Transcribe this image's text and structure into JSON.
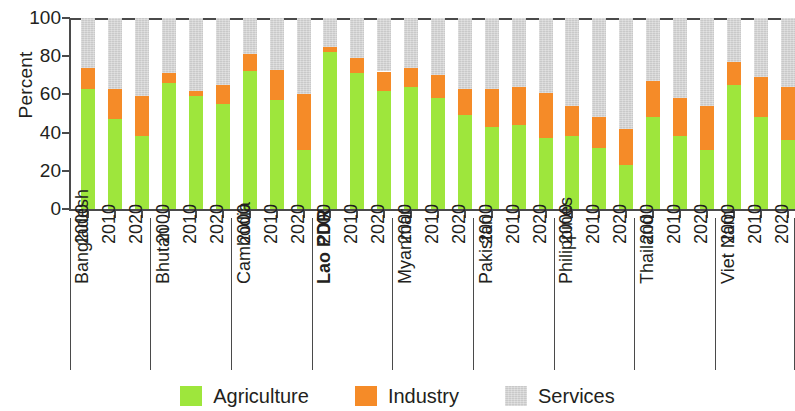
{
  "chart_data": {
    "type": "bar",
    "subtype": "stacked-bar-100",
    "title": "",
    "xlabel": "",
    "ylabel": "Percent",
    "ylim": [
      0,
      100
    ],
    "yticks": [
      0,
      20,
      40,
      60,
      80,
      100
    ],
    "ytick_labels": [
      "0",
      "20",
      "40",
      "60",
      "80",
      "100"
    ],
    "grid": false,
    "legend_position": "bottom-center",
    "legend": [
      "Agriculture",
      "Industry",
      "Services"
    ],
    "series_colors": {
      "Agriculture": "#9ee63c",
      "Industry": "#f58b28",
      "Services": "#c9c9c9"
    },
    "group_label": "country",
    "categories": [
      "2000",
      "2010",
      "2020"
    ],
    "groups": [
      {
        "name": "Bangladesh",
        "emphasis": false,
        "bars": [
          {
            "year": "2000",
            "Agriculture": 63,
            "Industry": 11,
            "Services": 26
          },
          {
            "year": "2010",
            "Agriculture": 47,
            "Industry": 16,
            "Services": 37
          },
          {
            "year": "2020",
            "Agriculture": 38,
            "Industry": 21,
            "Services": 41
          }
        ]
      },
      {
        "name": "Bhutan",
        "emphasis": false,
        "bars": [
          {
            "year": "2000",
            "Agriculture": 66,
            "Industry": 5,
            "Services": 29
          },
          {
            "year": "2010",
            "Agriculture": 59,
            "Industry": 3,
            "Services": 38
          },
          {
            "year": "2020",
            "Agriculture": 55,
            "Industry": 10,
            "Services": 35
          }
        ]
      },
      {
        "name": "Cambodia",
        "emphasis": false,
        "bars": [
          {
            "year": "2000",
            "Agriculture": 72,
            "Industry": 9,
            "Services": 19
          },
          {
            "year": "2010",
            "Agriculture": 57,
            "Industry": 16,
            "Services": 27
          },
          {
            "year": "2020",
            "Agriculture": 31,
            "Industry": 29,
            "Services": 40
          }
        ]
      },
      {
        "name": "Lao PDR",
        "emphasis": true,
        "bars": [
          {
            "year": "2000",
            "Agriculture": 82,
            "Industry": 3,
            "Services": 15
          },
          {
            "year": "2010",
            "Agriculture": 71,
            "Industry": 8,
            "Services": 21
          },
          {
            "year": "2020",
            "Agriculture": 62,
            "Industry": 10,
            "Services": 28
          }
        ]
      },
      {
        "name": "Myanmar",
        "emphasis": false,
        "bars": [
          {
            "year": "2000",
            "Agriculture": 64,
            "Industry": 10,
            "Services": 26
          },
          {
            "year": "2010",
            "Agriculture": 58,
            "Industry": 12,
            "Services": 30
          },
          {
            "year": "2020",
            "Agriculture": 49,
            "Industry": 14,
            "Services": 37
          }
        ]
      },
      {
        "name": "Pakistan",
        "emphasis": false,
        "bars": [
          {
            "year": "2000",
            "Agriculture": 43,
            "Industry": 20,
            "Services": 37
          },
          {
            "year": "2010",
            "Agriculture": 44,
            "Industry": 20,
            "Services": 36
          },
          {
            "year": "2020",
            "Agriculture": 37,
            "Industry": 24,
            "Services": 39
          }
        ]
      },
      {
        "name": "Philippines",
        "emphasis": false,
        "bars": [
          {
            "year": "2000",
            "Agriculture": 38,
            "Industry": 16,
            "Services": 46
          },
          {
            "year": "2010",
            "Agriculture": 32,
            "Industry": 16,
            "Services": 52
          },
          {
            "year": "2020",
            "Agriculture": 23,
            "Industry": 19,
            "Services": 58
          }
        ]
      },
      {
        "name": "Thailand",
        "emphasis": false,
        "bars": [
          {
            "year": "2000",
            "Agriculture": 48,
            "Industry": 19,
            "Services": 33
          },
          {
            "year": "2010",
            "Agriculture": 38,
            "Industry": 20,
            "Services": 42
          },
          {
            "year": "2020",
            "Agriculture": 31,
            "Industry": 23,
            "Services": 46
          }
        ]
      },
      {
        "name": "Viet Nam",
        "emphasis": false,
        "bars": [
          {
            "year": "2000",
            "Agriculture": 65,
            "Industry": 12,
            "Services": 23
          },
          {
            "year": "2010",
            "Agriculture": 48,
            "Industry": 21,
            "Services": 31
          },
          {
            "year": "2020",
            "Agriculture": 36,
            "Industry": 28,
            "Services": 36
          }
        ]
      }
    ]
  }
}
